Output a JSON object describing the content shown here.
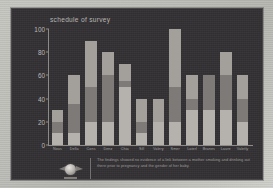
{
  "panel": {
    "background_color": "#333134",
    "border_color": "#4a474b"
  },
  "chart_data": {
    "type": "bar",
    "title": "schedule of survey",
    "xlabel": "",
    "ylabel": "",
    "ylim": [
      0,
      100
    ],
    "yticks": [
      0,
      20,
      40,
      60,
      80,
      100
    ],
    "grid": false,
    "legend": "none",
    "stacked": true,
    "categories": [
      "Nous",
      "Della",
      "Cons",
      "Denz",
      "Chia",
      "Sill",
      "Valery",
      "Smer",
      "Laterl",
      "Branes",
      "Laure",
      "Valetly"
    ],
    "series": [
      {
        "name": "segment-1",
        "color": "#b5b2ae",
        "values": [
          10,
          10,
          20,
          20,
          50,
          10,
          20,
          20,
          30,
          30,
          30,
          20
        ]
      },
      {
        "name": "segment-2",
        "color": "#7d7a78",
        "values": [
          10,
          25,
          30,
          40,
          5,
          10,
          0,
          30,
          10,
          30,
          30,
          20
        ]
      },
      {
        "name": "segment-3",
        "color": "#a3a09c",
        "values": [
          10,
          25,
          40,
          20,
          15,
          20,
          20,
          50,
          20,
          0,
          20,
          20
        ]
      }
    ],
    "totals": [
      30,
      60,
      90,
      80,
      70,
      40,
      40,
      100,
      60,
      60,
      80,
      60
    ]
  },
  "footer": {
    "emblem_name": "institution-emblem",
    "caption": "The findings showed no evidence of a link between a mother smoking and drinking out there prior to pregnancy and the gender of her baby."
  }
}
